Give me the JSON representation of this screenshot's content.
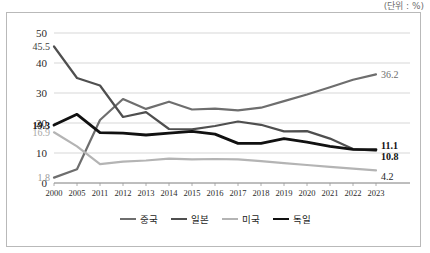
{
  "unit_note": "(단위 : %)",
  "legend": {
    "position": "bottom",
    "items": [
      {
        "label": "중국",
        "color": "#6e6e6e",
        "width": 2.2
      },
      {
        "label": "일본",
        "color": "#4f4f4f",
        "width": 2.2
      },
      {
        "label": "미국",
        "color": "#b4b4b4",
        "width": 2.2
      },
      {
        "label": "독일",
        "color": "#111111",
        "width": 2.8
      }
    ]
  },
  "chart_data": {
    "type": "line",
    "title": "",
    "subtitle": "",
    "xlabel": "",
    "ylabel": "",
    "unit": "%",
    "grid": true,
    "legend_position": "bottom",
    "ylim": [
      0,
      50
    ],
    "yticks": [
      0,
      10,
      20,
      30,
      40,
      50
    ],
    "categories": [
      "2000",
      "2005",
      "2011",
      "2012",
      "2013",
      "2014",
      "2015",
      "2016",
      "2017",
      "2018",
      "2019",
      "2020",
      "2021",
      "2022",
      "2023"
    ],
    "series": [
      {
        "name": "중국",
        "color": "#6e6e6e",
        "width": 2.2,
        "values": [
          1.8,
          4.6,
          21.0,
          28.0,
          24.7,
          27.1,
          24.5,
          24.8,
          24.2,
          25.1,
          27.3,
          29.5,
          31.9,
          34.4,
          36.2
        ],
        "start_label": "1.8",
        "end_label": "36.2"
      },
      {
        "name": "일본",
        "color": "#4f4f4f",
        "width": 2.2,
        "values": [
          45.5,
          35.0,
          32.5,
          22.0,
          23.6,
          18.0,
          17.9,
          19.0,
          20.5,
          19.4,
          17.2,
          17.3,
          14.8,
          11.3,
          10.8
        ],
        "start_label": "45.5",
        "end_label": "10.8"
      },
      {
        "name": "미국",
        "color": "#b4b4b4",
        "width": 2.2,
        "values": [
          16.9,
          12.2,
          6.3,
          7.1,
          7.5,
          8.1,
          7.9,
          8.0,
          7.9,
          7.3,
          6.6,
          6.0,
          5.4,
          4.8,
          4.2
        ],
        "start_label": "16.9",
        "end_label": "4.2"
      },
      {
        "name": "독일",
        "color": "#111111",
        "width": 2.8,
        "values": [
          19.3,
          22.9,
          16.8,
          16.6,
          16.0,
          16.6,
          17.2,
          16.3,
          13.2,
          13.2,
          14.8,
          13.6,
          12.2,
          11.2,
          11.1
        ],
        "start_label": "19.3",
        "end_label": "11.1"
      }
    ],
    "value_labels": {
      "left": [
        {
          "text": "45.5",
          "series": "일본",
          "value": 45.5,
          "bold": false,
          "color": "#3d3d3d"
        },
        {
          "text": "19.3",
          "series": "독일",
          "value": 19.3,
          "bold": true,
          "color": "#111111"
        },
        {
          "text": "16.9",
          "series": "미국",
          "value": 16.9,
          "bold": false,
          "color": "#a8a8a8"
        },
        {
          "text": "1.8",
          "series": "중국",
          "value": 1.8,
          "bold": false,
          "color": "#9a9a9a"
        }
      ],
      "right": [
        {
          "text": "36.2",
          "series": "중국",
          "value": 36.2,
          "bold": false,
          "color": "#6e6e6e"
        },
        {
          "text": "11.1",
          "series": "독일",
          "value": 11.1,
          "bold": true,
          "color": "#111111"
        },
        {
          "text": "10.8",
          "series": "일본",
          "value": 10.8,
          "bold": true,
          "color": "#1e1e1e"
        },
        {
          "text": "4.2",
          "series": "미국",
          "value": 4.2,
          "bold": false,
          "color": "#1e1e1e"
        }
      ]
    }
  }
}
